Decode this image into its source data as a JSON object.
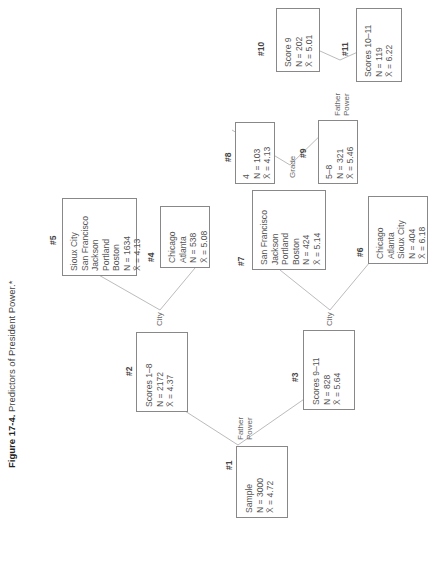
{
  "caption": {
    "label": "Figure 17-4.",
    "text": "Predictors of President Power.*"
  },
  "nodes": [
    {
      "id": "#1",
      "lines": [
        "Sample"
      ],
      "N": "N = 3000",
      "X": "X̄ = 4.72"
    },
    {
      "id": "#2",
      "lines": [
        "Scores 1–8"
      ],
      "N": "N = 2172",
      "X": "X̄ = 4.37"
    },
    {
      "id": "#3",
      "lines": [
        "Scores 9–11"
      ],
      "N": "N = 828",
      "X": "X̄ = 5.64"
    },
    {
      "id": "#4",
      "lines": [
        "Chicago",
        "Atlanta"
      ],
      "N": "N = 538",
      "X": "X̄ = 5.08"
    },
    {
      "id": "#5",
      "lines": [
        "Sioux City",
        "San Francisco",
        "Jackson",
        "Portland",
        "Boston"
      ],
      "N": "N = 1634",
      "X": "X̄ = 4.13"
    },
    {
      "id": "#6",
      "lines": [
        "Chicago",
        "Atlanta",
        "Sioux City"
      ],
      "N": "N = 404",
      "X": "X̄ = 6.18"
    },
    {
      "id": "#7",
      "lines": [
        "San Francisco",
        "Jackson",
        "Portland",
        "Boston"
      ],
      "N": "N = 424",
      "X": "X̄ = 5.14"
    },
    {
      "id": "#8",
      "lines": [
        "4"
      ],
      "N": "N = 103",
      "X": "X̄ = 4.13"
    },
    {
      "id": "#9",
      "lines": [
        "5–8"
      ],
      "N": "N = 321",
      "X": "X̄ = 5.46"
    },
    {
      "id": "#10",
      "lines": [
        "Score 9"
      ],
      "N": "N = 202",
      "X": "X̄ = 5.01"
    },
    {
      "id": "#11",
      "lines": [
        "Scores 10–11"
      ],
      "N": "N = 119",
      "X": "X̄ = 6.22"
    }
  ],
  "edges": {
    "split1": [
      "Father",
      "Power"
    ],
    "split2": "City",
    "split3": "City",
    "split7": "Grade",
    "split9": [
      "Father",
      "Power"
    ]
  }
}
